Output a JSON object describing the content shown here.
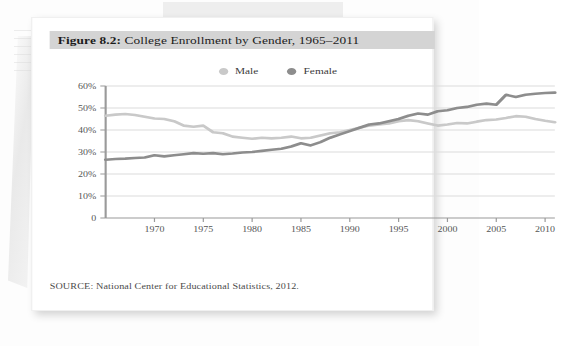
{
  "figure": {
    "label": "Figure 8.2:",
    "title": " College Enrollment by Gender, 1965–2011",
    "full_title": "Figure 8.2: College Enrollment by Gender, 1965–2011",
    "source": "SOURCE: National Center for Educational Statistics, 2012."
  },
  "legend": {
    "position": "top-center",
    "items": [
      {
        "label": "Male",
        "color": "#c9c9c9"
      },
      {
        "label": "Female",
        "color": "#8d8d8d"
      }
    ]
  },
  "colors": {
    "male_line": "#c9c9c9",
    "female_line": "#8d8d8d",
    "gridline": "#dcdcdc",
    "axis": "#9a9a9a",
    "title_banner": "#d4d4d4",
    "card": "#ffffff",
    "page": "#fdfdfd"
  },
  "chart_data": {
    "type": "line",
    "title": "College Enrollment by Gender, 1965–2011",
    "xlabel": "",
    "ylabel": "",
    "xlim": [
      1965,
      2011
    ],
    "ylim": [
      0,
      60
    ],
    "grid": true,
    "legend_position": "top-center",
    "ytick_labels": [
      "0",
      "10%",
      "20%",
      "30%",
      "40%",
      "50%",
      "60%"
    ],
    "ytick_values": [
      0,
      10,
      20,
      30,
      40,
      50,
      60
    ],
    "xtick_labels": [
      "1970",
      "1975",
      "1980",
      "1985",
      "1990",
      "1995",
      "2000",
      "2005",
      "2010"
    ],
    "xtick_values": [
      1970,
      1975,
      1980,
      1985,
      1990,
      1995,
      2000,
      2005,
      2010
    ],
    "x": [
      1965,
      1966,
      1967,
      1968,
      1969,
      1970,
      1971,
      1972,
      1973,
      1974,
      1975,
      1976,
      1977,
      1978,
      1979,
      1980,
      1981,
      1982,
      1983,
      1984,
      1985,
      1986,
      1987,
      1988,
      1989,
      1990,
      1991,
      1992,
      1993,
      1994,
      1995,
      1996,
      1997,
      1998,
      1999,
      2000,
      2001,
      2002,
      2003,
      2004,
      2005,
      2006,
      2007,
      2008,
      2009,
      2010,
      2011
    ],
    "series": [
      {
        "name": "Male",
        "color": "#c9c9c9",
        "values": [
          46.5,
          47.0,
          47.3,
          46.8,
          46.0,
          45.2,
          45.0,
          44.0,
          42.0,
          41.5,
          42.0,
          39.0,
          38.5,
          37.0,
          36.5,
          36.0,
          36.5,
          36.2,
          36.5,
          37.0,
          36.2,
          36.5,
          37.5,
          38.5,
          39.0,
          40.0,
          41.0,
          42.0,
          42.5,
          43.0,
          44.0,
          44.5,
          44.0,
          43.0,
          42.0,
          42.5,
          43.2,
          43.0,
          43.8,
          44.5,
          44.8,
          45.5,
          46.3,
          46.0,
          45.0,
          44.2,
          43.5
        ]
      },
      {
        "name": "Female",
        "color": "#8d8d8d",
        "values": [
          26.5,
          26.8,
          27.0,
          27.3,
          27.5,
          28.5,
          28.0,
          28.5,
          29.0,
          29.5,
          29.2,
          29.5,
          29.0,
          29.3,
          29.8,
          30.0,
          30.5,
          31.0,
          31.5,
          32.5,
          34.0,
          33.0,
          34.5,
          36.5,
          38.0,
          39.5,
          41.0,
          42.5,
          43.0,
          44.0,
          45.0,
          46.5,
          47.5,
          47.0,
          48.5,
          49.0,
          50.0,
          50.5,
          51.5,
          52.0,
          51.5,
          56.0,
          55.0,
          56.0,
          56.5,
          56.8,
          57.0
        ]
      }
    ]
  }
}
